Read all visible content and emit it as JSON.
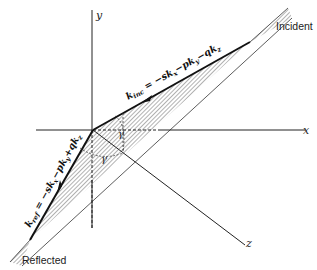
{
  "figure": {
    "axes": {
      "x_label": "x",
      "y_label": "y",
      "z_label": "z"
    },
    "labels": {
      "incident": "Incident",
      "reflected": "Reflected"
    },
    "vectors": {
      "incident": "k",
      "incident_sub": "inc",
      "incident_expr": " = −sk",
      "incident_expr2": "−pk",
      "incident_expr3": "−qk",
      "reflected": "k",
      "reflected_sub": "ref",
      "reflected_expr": " = −sk",
      "reflected_expr2": "−pk",
      "reflected_expr3": "+qk",
      "sub_x": "x",
      "sub_y": "y",
      "sub_z": "z",
      "incident_full": "k_inc = −s k_x − p k_y − q k_z",
      "reflected_full": "k_ref = −s k_x − p k_y + q k_z"
    },
    "angles": {
      "gamma_1": "γ",
      "gamma_2": "γ"
    },
    "colors": {
      "line": "#222222",
      "hatch": "#555555",
      "background": "#ffffff"
    }
  }
}
